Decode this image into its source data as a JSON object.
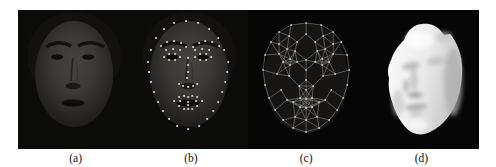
{
  "figure": {
    "labels": [
      {
        "text": "(a)"
      },
      {
        "text": "(b)"
      },
      {
        "text": "(c)"
      },
      {
        "text": "(d)"
      }
    ]
  },
  "colors": {
    "page_background": "#ffffff",
    "strip_background": "#060606",
    "photo_background": "#0b0b0a",
    "label_text": "#111111",
    "landmark_dot": "#d9d3bb",
    "mesh_line": "#9f9f94",
    "mesh_dot": "#c6c4b4",
    "model_base": "#f2f2f2"
  },
  "landmarks": {
    "dot_radius": 1.1,
    "points": [
      [
        15,
        52
      ],
      [
        16,
        62
      ],
      [
        18,
        72
      ],
      [
        21,
        82
      ],
      [
        25,
        92
      ],
      [
        30,
        101
      ],
      [
        36,
        109
      ],
      [
        44,
        116
      ],
      [
        55,
        119
      ],
      [
        66,
        116
      ],
      [
        74,
        109
      ],
      [
        80,
        101
      ],
      [
        85,
        92
      ],
      [
        89,
        82
      ],
      [
        92,
        72
      ],
      [
        94,
        62
      ],
      [
        95,
        52
      ],
      [
        18,
        40
      ],
      [
        23,
        28
      ],
      [
        31,
        19
      ],
      [
        41,
        13
      ],
      [
        53,
        11
      ],
      [
        65,
        13
      ],
      [
        76,
        19
      ],
      [
        85,
        28
      ],
      [
        91,
        40
      ],
      [
        28,
        36
      ],
      [
        34,
        32
      ],
      [
        41,
        31
      ],
      [
        48,
        33
      ],
      [
        53,
        37
      ],
      [
        60,
        37
      ],
      [
        66,
        33
      ],
      [
        72,
        31
      ],
      [
        79,
        32
      ],
      [
        86,
        36
      ],
      [
        33,
        40
      ],
      [
        40,
        39
      ],
      [
        47,
        40
      ],
      [
        62,
        40
      ],
      [
        69,
        39
      ],
      [
        76,
        40
      ],
      [
        31,
        47
      ],
      [
        36,
        44
      ],
      [
        42,
        44
      ],
      [
        47,
        47
      ],
      [
        42,
        50
      ],
      [
        36,
        50
      ],
      [
        62,
        47
      ],
      [
        67,
        44
      ],
      [
        73,
        44
      ],
      [
        78,
        47
      ],
      [
        73,
        50
      ],
      [
        67,
        50
      ],
      [
        55,
        48
      ],
      [
        55,
        55
      ],
      [
        55,
        62
      ],
      [
        54,
        68
      ],
      [
        46,
        74
      ],
      [
        50,
        76
      ],
      [
        55,
        77
      ],
      [
        60,
        76
      ],
      [
        64,
        74
      ],
      [
        41,
        91
      ],
      [
        46,
        87
      ],
      [
        51,
        86
      ],
      [
        55,
        87
      ],
      [
        59,
        86
      ],
      [
        64,
        87
      ],
      [
        69,
        91
      ],
      [
        64,
        96
      ],
      [
        59,
        99
      ],
      [
        55,
        99
      ],
      [
        51,
        99
      ],
      [
        46,
        96
      ],
      [
        47,
        91
      ],
      [
        55,
        92
      ],
      [
        63,
        91
      ],
      [
        55,
        95
      ]
    ]
  },
  "mesh": {
    "dot_radius": 0.9,
    "edge_threshold": 16,
    "points": [
      [
        16,
        45
      ],
      [
        14,
        60
      ],
      [
        16,
        75
      ],
      [
        20,
        88
      ],
      [
        26,
        100
      ],
      [
        34,
        110
      ],
      [
        44,
        118
      ],
      [
        57,
        122
      ],
      [
        70,
        118
      ],
      [
        80,
        110
      ],
      [
        88,
        100
      ],
      [
        94,
        88
      ],
      [
        98,
        75
      ],
      [
        100,
        60
      ],
      [
        98,
        45
      ],
      [
        92,
        32
      ],
      [
        84,
        22
      ],
      [
        72,
        15
      ],
      [
        57,
        13
      ],
      [
        42,
        15
      ],
      [
        30,
        22
      ],
      [
        22,
        32
      ],
      [
        40,
        26
      ],
      [
        57,
        24
      ],
      [
        74,
        26
      ],
      [
        30,
        34
      ],
      [
        84,
        34
      ],
      [
        48,
        32
      ],
      [
        66,
        32
      ],
      [
        30,
        44
      ],
      [
        38,
        39
      ],
      [
        46,
        41
      ],
      [
        68,
        41
      ],
      [
        76,
        39
      ],
      [
        84,
        44
      ],
      [
        34,
        52
      ],
      [
        41,
        49
      ],
      [
        48,
        52
      ],
      [
        41,
        55
      ],
      [
        66,
        52
      ],
      [
        73,
        49
      ],
      [
        80,
        52
      ],
      [
        73,
        55
      ],
      [
        57,
        50
      ],
      [
        57,
        60
      ],
      [
        57,
        70
      ],
      [
        50,
        76
      ],
      [
        57,
        80
      ],
      [
        64,
        76
      ],
      [
        28,
        64
      ],
      [
        86,
        64
      ],
      [
        32,
        80
      ],
      [
        82,
        80
      ],
      [
        40,
        66
      ],
      [
        74,
        66
      ],
      [
        38,
        90
      ],
      [
        76,
        90
      ],
      [
        44,
        92
      ],
      [
        51,
        88
      ],
      [
        57,
        89
      ],
      [
        63,
        88
      ],
      [
        70,
        92
      ],
      [
        63,
        97
      ],
      [
        57,
        98
      ],
      [
        51,
        97
      ],
      [
        57,
        110
      ],
      [
        46,
        107
      ],
      [
        68,
        107
      ]
    ]
  }
}
